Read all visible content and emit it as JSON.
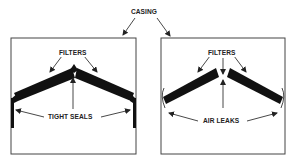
{
  "title_label": "CASING",
  "left_panel": {
    "name": "Correct installation",
    "filters_label": "FILTERS",
    "seals_label": "TIGHT SEALS"
  },
  "right_panel": {
    "name": "Incorrect installation",
    "filters_label": "FILTERS",
    "leaks_label": "AIR LEAKS"
  },
  "colors": {
    "line": "#333333",
    "filter": "#111111",
    "background": "#ffffff"
  }
}
